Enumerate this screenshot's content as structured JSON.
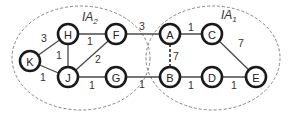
{
  "diagram": {
    "type": "weighted-graph",
    "regions": [
      {
        "id": "IA2",
        "label": "IA",
        "sub": "2",
        "cx": 81,
        "cy": 58,
        "rx": 69,
        "ry": 52,
        "label_x": 82,
        "label_y": 21
      },
      {
        "id": "IA1",
        "label": "IA",
        "sub": "1",
        "cx": 213,
        "cy": 58,
        "rx": 67,
        "ry": 52,
        "label_x": 221,
        "label_y": 19
      }
    ],
    "nodes": [
      {
        "id": "K",
        "label": "K",
        "x": 30,
        "y": 61
      },
      {
        "id": "H",
        "label": "H",
        "x": 68,
        "y": 34
      },
      {
        "id": "J",
        "label": "J",
        "x": 68,
        "y": 77
      },
      {
        "id": "F",
        "label": "F",
        "x": 116,
        "y": 34
      },
      {
        "id": "G",
        "label": "G",
        "x": 116,
        "y": 77
      },
      {
        "id": "A",
        "label": "A",
        "x": 170,
        "y": 34
      },
      {
        "id": "B",
        "label": "B",
        "x": 170,
        "y": 77
      },
      {
        "id": "C",
        "label": "C",
        "x": 212,
        "y": 34
      },
      {
        "id": "D",
        "label": "D",
        "x": 212,
        "y": 77
      },
      {
        "id": "E",
        "label": "E",
        "x": 256,
        "y": 77
      }
    ],
    "edges": [
      {
        "from": "K",
        "to": "H",
        "weight": "3",
        "lx": 44,
        "ly": 38,
        "dashed": false
      },
      {
        "from": "K",
        "to": "J",
        "weight": "1",
        "lx": 43,
        "ly": 77,
        "dashed": false
      },
      {
        "from": "H",
        "to": "J",
        "weight": "1",
        "lx": 59,
        "ly": 55,
        "dashed": false
      },
      {
        "from": "H",
        "to": "F",
        "weight": "1",
        "lx": 90,
        "ly": 41,
        "dashed": false
      },
      {
        "from": "J",
        "to": "F",
        "weight": "2",
        "lx": 98,
        "ly": 59,
        "dashed": false
      },
      {
        "from": "J",
        "to": "G",
        "weight": "1",
        "lx": 92,
        "ly": 85,
        "dashed": false
      },
      {
        "from": "F",
        "to": "A",
        "weight": "3",
        "lx": 142,
        "ly": 26,
        "dashed": false
      },
      {
        "from": "G",
        "to": "B",
        "weight": "1",
        "lx": 142,
        "ly": 84,
        "dashed": false
      },
      {
        "from": "A",
        "to": "C",
        "weight": "1",
        "lx": 191,
        "ly": 27,
        "dashed": false
      },
      {
        "from": "A",
        "to": "B",
        "weight": "7",
        "lx": 176,
        "ly": 56,
        "dashed": true
      },
      {
        "from": "C",
        "to": "E",
        "weight": "7",
        "lx": 241,
        "ly": 43,
        "dashed": false
      },
      {
        "from": "B",
        "to": "D",
        "weight": "1",
        "lx": 191,
        "ly": 85,
        "dashed": false
      },
      {
        "from": "D",
        "to": "E",
        "weight": "1",
        "lx": 234,
        "ly": 85,
        "dashed": false
      }
    ]
  }
}
